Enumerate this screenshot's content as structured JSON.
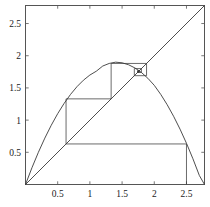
{
  "figure": {
    "kind": "cobweb-plot",
    "background_color": "#ffffff",
    "line_color": "#3a3a3a",
    "axis_color": "#555555",
    "text_color": "#1a1a1a"
  },
  "axes": {
    "x_label": "",
    "y_label": "",
    "xlim": [
      0.0,
      2.78
    ],
    "ylim": [
      0.0,
      2.78
    ],
    "x_tick_labels": [
      "0.5",
      "1",
      "1.5",
      "2",
      "2.5"
    ],
    "x_tick_values": [
      0.5,
      1.0,
      1.5,
      2.0,
      2.5
    ],
    "y_tick_labels": [
      "0.5",
      "1",
      "1.5",
      "2",
      "2.5"
    ],
    "y_tick_values": [
      0.5,
      1.0,
      1.5,
      2.0,
      2.5
    ],
    "frame": true,
    "grid": false
  },
  "chart_data": {
    "type": "line",
    "title": "",
    "xlabel": "",
    "ylabel": "",
    "xlim": [
      0.0,
      2.78
    ],
    "ylim": [
      0.0,
      2.78
    ],
    "grid": false,
    "legend_position": "none",
    "series": [
      {
        "name": "map-curve",
        "role": "parabola",
        "description": "Unimodal map f(x) peaking near (1.40, 1.90), passing through origin and returning to zero near x = 2.78",
        "x": [
          0.0,
          0.1,
          0.2,
          0.3,
          0.4,
          0.5,
          0.6,
          0.7,
          0.8,
          0.9,
          1.0,
          1.1,
          1.2,
          1.3,
          1.4,
          1.5,
          1.6,
          1.7,
          1.8,
          1.9,
          2.0,
          2.1,
          2.2,
          2.3,
          2.4,
          2.5,
          2.6,
          2.7,
          2.78
        ],
        "y": [
          0.0,
          0.26,
          0.5,
          0.72,
          0.92,
          1.1,
          1.26,
          1.4,
          1.52,
          1.62,
          1.7,
          1.76,
          1.84,
          1.88,
          1.9,
          1.89,
          1.86,
          1.81,
          1.74,
          1.65,
          1.54,
          1.4,
          1.24,
          1.06,
          0.86,
          0.64,
          0.4,
          0.14,
          0.0
        ]
      },
      {
        "name": "identity-line",
        "role": "diagonal",
        "description": "y = x reference diagonal from (0,0) to (2.78,2.78)",
        "x": [
          0.0,
          2.78
        ],
        "y": [
          0.0,
          2.78
        ]
      }
    ],
    "cobweb": {
      "description": "Staircase / spiral iteration path of the map, converging to the fixed point",
      "start_x": 2.5,
      "fixed_point": [
        1.73,
        1.73
      ],
      "orbit": [
        2.5,
        0.63,
        1.33,
        1.88,
        1.69,
        1.8,
        1.74,
        1.77,
        1.745,
        1.755,
        1.748,
        1.752,
        1.7495,
        1.7512,
        1.7501,
        1.7507,
        1.7503,
        1.7505,
        1.7504,
        1.75045
      ]
    }
  }
}
